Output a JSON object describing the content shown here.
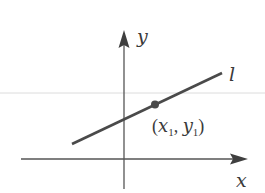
{
  "diagram": {
    "title": "",
    "axes": {
      "x_label": "x",
      "y_label": "y"
    },
    "line": {
      "label": "l"
    },
    "point": {
      "label_open": "(",
      "x_var": "x",
      "x_sub": "1",
      "sep": ", ",
      "y_var": "y",
      "y_sub": "1",
      "label_close": ")"
    },
    "colors": {
      "axis": "#555555",
      "line": "#4a4a4a",
      "point": "#4a4a4a",
      "guide": "#d8d8d8",
      "text": "#3a3a3a"
    }
  }
}
